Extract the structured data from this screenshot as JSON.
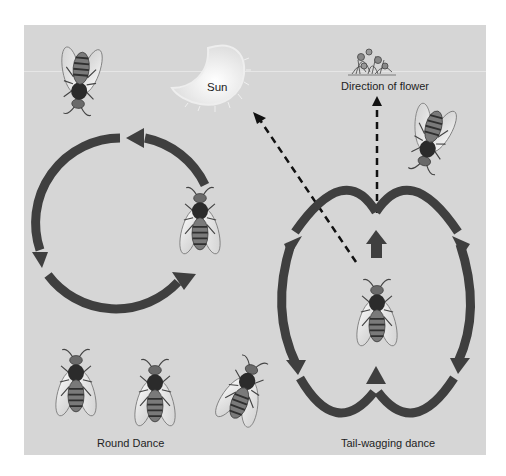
{
  "labels": {
    "sun": "Sun",
    "flower_direction": "Direction of flower",
    "round_dance": "Round Dance",
    "tail_wagging_dance": "Tail-wagging dance"
  },
  "icons": {
    "sun": "sun-icon",
    "flower": "flower-cluster-icon",
    "bee": "honeybee-icon"
  },
  "colors": {
    "background": "#d6d6d6",
    "arrow": "#3f3f3f",
    "dashed_line": "#111111",
    "sun": "#f2f2f2"
  },
  "diagram": {
    "panels": [
      {
        "name": "Round Dance",
        "bee_count": 5,
        "path": "circle"
      },
      {
        "name": "Tail-wagging dance",
        "bee_count": 2,
        "path": "figure-eight with straight waggle run"
      }
    ],
    "dashed_lines": [
      {
        "from": "waggle-run",
        "to": "Sun"
      },
      {
        "from": "waggle-run",
        "to": "Direction of flower"
      }
    ]
  }
}
